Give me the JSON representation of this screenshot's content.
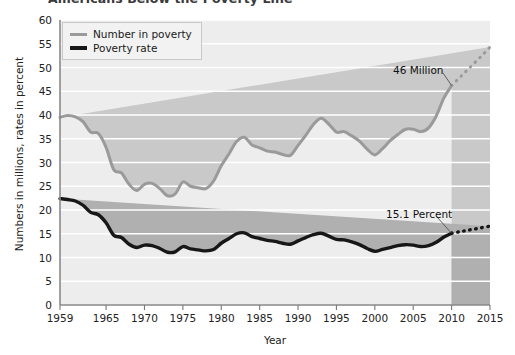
{
  "chart_data": {
    "type": "line",
    "title": "Americans Below the Poverty Line",
    "xlabel": "Year",
    "ylabel": "Numbers in millions, rates in percent",
    "xlim": [
      1959,
      2015
    ],
    "ylim": [
      0,
      60
    ],
    "ytick_step": 5,
    "grid": "horizontal-white",
    "legend_position": "top-left",
    "ytick_labels": [
      "0",
      "5",
      "10",
      "15",
      "20",
      "25",
      "30",
      "35",
      "40",
      "45",
      "50",
      "55",
      "60"
    ],
    "xtick_labels": [
      "1959",
      "1965",
      "1970",
      "1975",
      "1980",
      "1985",
      "1990",
      "1995",
      "2000",
      "2005",
      "2010",
      "2015"
    ],
    "xticks": [
      1959,
      1965,
      1970,
      1975,
      1980,
      1985,
      1990,
      1995,
      2000,
      2005,
      2010,
      2015
    ],
    "colors": {
      "number_in_poverty": "#9a9a9a",
      "poverty_rate": "#171717",
      "band_above_gray": "#ededed",
      "band_between": "#c9c9c9",
      "band_below_black": "#b0b0b0",
      "gridline": "#ffffff",
      "axis": "#8a8a8a"
    },
    "x": [
      1959,
      1960,
      1961,
      1962,
      1963,
      1964,
      1965,
      1966,
      1967,
      1968,
      1969,
      1970,
      1971,
      1972,
      1973,
      1974,
      1975,
      1976,
      1977,
      1978,
      1979,
      1980,
      1981,
      1982,
      1983,
      1984,
      1985,
      1986,
      1987,
      1988,
      1989,
      1990,
      1991,
      1992,
      1993,
      1994,
      1995,
      1996,
      1997,
      1998,
      1999,
      2000,
      2001,
      2002,
      2003,
      2004,
      2005,
      2006,
      2007,
      2008,
      2009,
      2010
    ],
    "series": [
      {
        "name": "Number in poverty",
        "unit": "millions",
        "color": "#9a9a9a",
        "style": "solid",
        "values": [
          39.5,
          39.9,
          39.6,
          38.6,
          36.4,
          36.1,
          33.2,
          28.5,
          27.8,
          25.4,
          24.1,
          25.4,
          25.6,
          24.5,
          23.0,
          23.4,
          25.9,
          25.0,
          24.7,
          24.5,
          26.1,
          29.3,
          31.8,
          34.4,
          35.3,
          33.7,
          33.1,
          32.4,
          32.2,
          31.7,
          31.5,
          33.6,
          35.7,
          38.0,
          39.3,
          38.1,
          36.4,
          36.5,
          35.6,
          34.5,
          32.8,
          31.6,
          32.9,
          34.6,
          35.9,
          37.0,
          37.0,
          36.5,
          37.3,
          39.8,
          43.6,
          46.2
        ]
      },
      {
        "name": "Poverty rate",
        "unit": "percent",
        "color": "#171717",
        "style": "solid",
        "values": [
          22.4,
          22.2,
          21.9,
          21.0,
          19.5,
          19.0,
          17.3,
          14.7,
          14.2,
          12.8,
          12.1,
          12.6,
          12.5,
          11.9,
          11.1,
          11.2,
          12.3,
          11.8,
          11.6,
          11.4,
          11.7,
          13.0,
          14.0,
          15.0,
          15.2,
          14.4,
          14.0,
          13.6,
          13.4,
          13.0,
          12.8,
          13.5,
          14.2,
          14.8,
          15.1,
          14.5,
          13.8,
          13.7,
          13.3,
          12.7,
          11.9,
          11.3,
          11.7,
          12.1,
          12.5,
          12.7,
          12.6,
          12.3,
          12.5,
          13.2,
          14.3,
          15.1
        ]
      }
    ],
    "projection": {
      "style": "dotted",
      "x": [
        2010,
        2011,
        2012,
        2013,
        2014,
        2015
      ],
      "series": [
        {
          "name": "Number in poverty",
          "values": [
            46.2,
            47.8,
            49.4,
            51.0,
            52.6,
            54.3
          ]
        },
        {
          "name": "Poverty rate",
          "values": [
            15.1,
            15.4,
            15.7,
            16.0,
            16.3,
            16.6
          ]
        }
      ]
    },
    "annotations": [
      {
        "text": "46 Million",
        "x": 2010,
        "y": 46.2
      },
      {
        "text": "15.1 Percent",
        "x": 2010,
        "y": 15.1
      }
    ]
  },
  "legend": {
    "items": [
      {
        "label": "Number in poverty"
      },
      {
        "label": "Poverty rate"
      }
    ]
  }
}
